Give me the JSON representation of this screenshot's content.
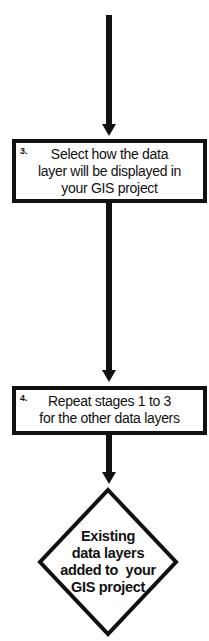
{
  "flowchart": {
    "steps": [
      {
        "number": "3.",
        "text_lines": [
          "Select how the data",
          "layer will be displayed in",
          "your GIS project"
        ]
      },
      {
        "number": "4.",
        "text_lines": [
          "Repeat stages 1 to 3",
          "for the other data layers"
        ]
      }
    ],
    "end": {
      "text_lines": [
        "Existing",
        "data layers",
        "added to  your",
        "GIS project"
      ]
    }
  }
}
